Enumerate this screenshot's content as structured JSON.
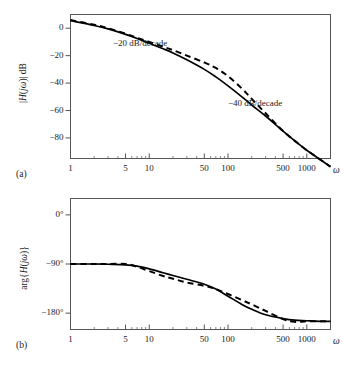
{
  "figure": {
    "background": "#ffffff",
    "line_color": "#000000",
    "axis_color": "#555555",
    "width": 343,
    "height": 370
  },
  "panels": [
    {
      "tag": "(a)",
      "y_axis_label": "|H(jω)| dB",
      "x_axis_label": "ω",
      "y_ticks": [
        "0",
        "−20",
        "−40",
        "−60",
        "−80"
      ],
      "x_ticks": [
        "1",
        "5",
        "10",
        "50",
        "100",
        "500",
        "1000"
      ],
      "annotations": [
        "−20 dB/decade",
        "−40 dB/decade"
      ]
    },
    {
      "tag": "(b)",
      "y_axis_label": "arg{H(jω)}",
      "x_axis_label": "ω",
      "y_ticks": [
        "0°",
        "−90°",
        "−180°"
      ],
      "x_ticks": [
        "1",
        "5",
        "10",
        "50",
        "100",
        "500",
        "1000"
      ],
      "annotations": []
    }
  ],
  "chart_data": [
    {
      "type": "line",
      "id": "magnitude-plot",
      "title": "",
      "xlabel": "ω",
      "ylabel": "|H(jω)| dB",
      "xscale": "log",
      "xlim": [
        1,
        2000
      ],
      "ylim": [
        -95,
        10
      ],
      "xticks": [
        1,
        5,
        10,
        50,
        100,
        500,
        1000
      ],
      "xticklabels": [
        "1",
        "5",
        "10",
        "50",
        "100",
        "500",
        "1000"
      ],
      "yticks": [
        0,
        -20,
        -40,
        -60,
        -80
      ],
      "yticklabels": [
        "0",
        "−20",
        "−40",
        "−60",
        "−80"
      ],
      "grid": false,
      "legend": "none",
      "annotations": [
        {
          "text": "−20 dB/decade",
          "x": 12,
          "y": -4
        },
        {
          "text": "−40 dB/decade",
          "x": 230,
          "y": -48
        }
      ],
      "series": [
        {
          "name": "exact magnitude",
          "style": "solid",
          "x": [
            1,
            2,
            3,
            5,
            7,
            10,
            15,
            20,
            30,
            50,
            70,
            100,
            150,
            200,
            300,
            500,
            700,
            1000,
            1500,
            2000
          ],
          "values": [
            5.5,
            2.0,
            -0.5,
            -4.5,
            -7.5,
            -11.0,
            -15.0,
            -18.0,
            -23.0,
            -30.0,
            -35.5,
            -42.0,
            -50.0,
            -56.0,
            -64.0,
            -75.0,
            -82.0,
            -89.0,
            -96.0,
            -101.0
          ]
        },
        {
          "name": "asymptotic approximation",
          "style": "dashed",
          "x": [
            1,
            2,
            3,
            5,
            7,
            10,
            15,
            20,
            30,
            50,
            70,
            100,
            150,
            200,
            300,
            500,
            700,
            1000,
            1500,
            2000
          ],
          "values": [
            6.0,
            2.5,
            0.0,
            -4.0,
            -7.0,
            -10.0,
            -13.5,
            -16.0,
            -20.0,
            -25.0,
            -29.0,
            -35.0,
            -44.0,
            -51.5,
            -62.0,
            -75.0,
            -82.0,
            -89.0,
            -96.0,
            -101.0
          ]
        }
      ]
    },
    {
      "type": "line",
      "id": "phase-plot",
      "title": "",
      "xlabel": "ω",
      "ylabel": "arg{H(jω)}",
      "xscale": "log",
      "xlim": [
        1,
        2000
      ],
      "ylim": [
        -210,
        30
      ],
      "xticks": [
        1,
        5,
        10,
        50,
        100,
        500,
        1000
      ],
      "xticklabels": [
        "1",
        "5",
        "10",
        "50",
        "100",
        "500",
        "1000"
      ],
      "yticks": [
        0,
        -90,
        -180
      ],
      "yticklabels": [
        "0°",
        "−90°",
        "−180°"
      ],
      "grid": false,
      "legend": "none",
      "annotations": [],
      "series": [
        {
          "name": "exact phase",
          "style": "solid",
          "x": [
            1,
            2,
            3,
            5,
            7,
            10,
            15,
            20,
            30,
            50,
            70,
            100,
            150,
            200,
            300,
            500,
            700,
            1000,
            1500,
            2000
          ],
          "values": [
            -90,
            -90,
            -90.5,
            -91.5,
            -94,
            -99,
            -106,
            -111,
            -118,
            -127,
            -136,
            -149,
            -164,
            -173,
            -183,
            -190,
            -193,
            -194,
            -195,
            -195
          ]
        },
        {
          "name": "asymptotic approximation",
          "style": "dashed",
          "x": [
            1,
            2,
            3,
            5,
            7,
            10,
            15,
            20,
            30,
            50,
            70,
            100,
            150,
            200,
            300,
            500,
            700,
            1000,
            1500,
            2000
          ],
          "values": [
            -90,
            -90,
            -90,
            -90,
            -95,
            -103,
            -112,
            -117,
            -124,
            -130,
            -136,
            -145,
            -156,
            -164,
            -176,
            -191,
            -196,
            -195,
            -195,
            -195
          ]
        }
      ]
    }
  ]
}
